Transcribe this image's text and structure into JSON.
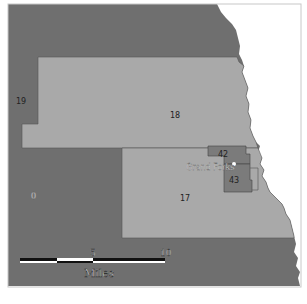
{
  "map": {
    "colors": {
      "outside_district": "#6f6f6f",
      "district_light": "#a9a9a9",
      "district_small": "#7a7a7a",
      "river_side": "#ffffff",
      "frame": "#d0d0d0"
    },
    "districts": [
      {
        "id": "19",
        "label": "19"
      },
      {
        "id": "18",
        "label": "18"
      },
      {
        "id": "17",
        "label": "17"
      },
      {
        "id": "42",
        "label": "42"
      },
      {
        "id": "43",
        "label": "43"
      },
      {
        "id": "0",
        "label": "0"
      }
    ],
    "city": {
      "name": "Grand Forks"
    },
    "scale_bar": {
      "ticks": [
        "5",
        "10"
      ],
      "unit": "Miles"
    }
  }
}
